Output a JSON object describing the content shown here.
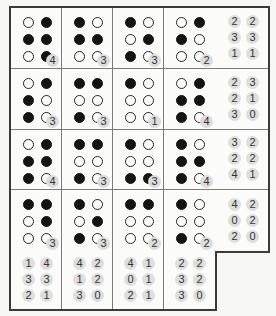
{
  "puzzle": {
    "rows": 4,
    "cols": 4,
    "cells": [
      {
        "dots": [
          [
            0,
            1
          ],
          [
            1,
            1
          ],
          [
            0,
            1
          ]
        ],
        "badge": "4"
      },
      {
        "dots": [
          [
            1,
            0
          ],
          [
            1,
            1
          ],
          [
            0,
            0
          ]
        ],
        "badge": "3"
      },
      {
        "dots": [
          [
            1,
            0
          ],
          [
            0,
            1
          ],
          [
            1,
            0
          ]
        ],
        "badge": "3"
      },
      {
        "dots": [
          [
            0,
            1
          ],
          [
            1,
            0
          ],
          [
            0,
            0
          ]
        ],
        "badge": "2"
      },
      {
        "dots": [
          [
            0,
            1
          ],
          [
            1,
            0
          ],
          [
            1,
            0
          ]
        ],
        "badge": "3"
      },
      {
        "dots": [
          [
            1,
            1
          ],
          [
            0,
            0
          ],
          [
            1,
            0
          ]
        ],
        "badge": "3"
      },
      {
        "dots": [
          [
            1,
            0
          ],
          [
            0,
            0
          ],
          [
            0,
            0
          ]
        ],
        "badge": "1"
      },
      {
        "dots": [
          [
            0,
            1
          ],
          [
            1,
            1
          ],
          [
            1,
            0
          ]
        ],
        "badge": "4"
      },
      {
        "dots": [
          [
            0,
            1
          ],
          [
            1,
            1
          ],
          [
            1,
            0
          ]
        ],
        "badge": "4"
      },
      {
        "dots": [
          [
            1,
            1
          ],
          [
            0,
            0
          ],
          [
            1,
            0
          ]
        ],
        "badge": "3"
      },
      {
        "dots": [
          [
            1,
            0
          ],
          [
            0,
            0
          ],
          [
            1,
            1
          ]
        ],
        "badge": "3"
      },
      {
        "dots": [
          [
            1,
            0
          ],
          [
            1,
            1
          ],
          [
            1,
            0
          ]
        ],
        "badge": "4"
      },
      {
        "dots": [
          [
            1,
            1
          ],
          [
            0,
            1
          ],
          [
            0,
            0
          ]
        ],
        "badge": "3"
      },
      {
        "dots": [
          [
            1,
            0
          ],
          [
            0,
            1
          ],
          [
            1,
            0
          ]
        ],
        "badge": "3"
      },
      {
        "dots": [
          [
            1,
            1
          ],
          [
            0,
            0
          ],
          [
            0,
            0
          ]
        ],
        "badge": "2"
      },
      {
        "dots": [
          [
            1,
            0
          ],
          [
            0,
            0
          ],
          [
            1,
            0
          ]
        ],
        "badge": "2"
      }
    ],
    "right_clues": [
      [
        [
          "2",
          "2"
        ],
        [
          "3",
          "3"
        ],
        [
          "1",
          "1"
        ]
      ],
      [
        [
          "2",
          "3"
        ],
        [
          "2",
          "1"
        ],
        [
          "3",
          "0"
        ]
      ],
      [
        [
          "3",
          "2"
        ],
        [
          "2",
          "2"
        ],
        [
          "4",
          "1"
        ]
      ],
      [
        [
          "4",
          "2"
        ],
        [
          "0",
          "2"
        ],
        [
          "2",
          "0"
        ]
      ]
    ],
    "bottom_clues": [
      [
        [
          "1",
          "4"
        ],
        [
          "3",
          "3"
        ],
        [
          "2",
          "1"
        ]
      ],
      [
        [
          "4",
          "2"
        ],
        [
          "1",
          "2"
        ],
        [
          "3",
          "0"
        ]
      ],
      [
        [
          "4",
          "1"
        ],
        [
          "0",
          "1"
        ],
        [
          "2",
          "1"
        ]
      ],
      [
        [
          "2",
          "2"
        ],
        [
          "3",
          "2"
        ],
        [
          "3",
          "0"
        ]
      ]
    ],
    "colors": {
      "filled_dot": "#141414",
      "empty_dot": "#ffffff",
      "badge_bg": "#dcdcdc",
      "border": "#3a3a3a"
    }
  }
}
